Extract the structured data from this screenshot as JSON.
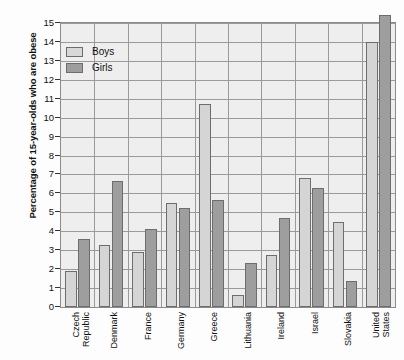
{
  "chart_data": {
    "type": "bar",
    "title": "",
    "xlabel": "",
    "ylabel": "Percentage of 15-year-olds who are obese",
    "ylim": [
      0,
      15
    ],
    "ytick_step": 1,
    "yticks": [
      "0",
      "1",
      "2",
      "3",
      "4",
      "5",
      "6",
      "7",
      "8",
      "9",
      "10",
      "11",
      "12",
      "13",
      "14",
      "15"
    ],
    "grid": true,
    "legend_position": "top-left",
    "categories": [
      "Czech Republic",
      "Denmark",
      "France",
      "Germany",
      "Greece",
      "Lithuania",
      "Ireland",
      "Israel",
      "Slovakia",
      "United States"
    ],
    "category_lines": [
      [
        "Czech",
        "Republic"
      ],
      [
        "Denmark"
      ],
      [
        "France"
      ],
      [
        "Germany"
      ],
      [
        "Greece"
      ],
      [
        "Lithuania"
      ],
      [
        "Ireland"
      ],
      [
        "Israel"
      ],
      [
        "Slovakia"
      ],
      [
        "United",
        "States"
      ]
    ],
    "series": [
      {
        "name": "Boys",
        "color": "#d5d5d5",
        "values": [
          1.9,
          3.25,
          2.9,
          5.5,
          10.7,
          0.65,
          2.75,
          6.8,
          4.5,
          14.0
        ]
      },
      {
        "name": "Girls",
        "color": "#9e9e9e",
        "values": [
          3.6,
          6.65,
          4.1,
          5.25,
          5.65,
          2.3,
          4.7,
          6.3,
          1.4,
          15.4
        ]
      }
    ]
  },
  "legend": {
    "items": [
      {
        "label": "Boys",
        "swatch": "boys"
      },
      {
        "label": "Girls",
        "swatch": "girls"
      }
    ]
  }
}
